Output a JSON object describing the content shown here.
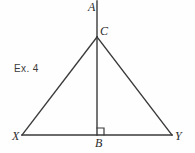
{
  "figure": {
    "caption": "Ex. 4",
    "background_color": "#fefefe",
    "stroke_color": "#3a3a3a",
    "text_color": "#2b2b2b",
    "labels": {
      "apex_ray_top": "A",
      "apex": "C",
      "foot": "B",
      "left_base": "X",
      "right_base": "Y"
    },
    "right_angle_mark": {
      "at": "B",
      "size_px": 7
    },
    "geometry": {
      "points": {
        "A": {
          "x": 97,
          "y": 1
        },
        "C": {
          "x": 97,
          "y": 37
        },
        "B": {
          "x": 97,
          "y": 135
        },
        "X": {
          "x": 22,
          "y": 135
        },
        "Y": {
          "x": 172,
          "y": 135
        }
      },
      "segments": [
        {
          "name": "ray-AC",
          "from": "A",
          "to": "C"
        },
        {
          "name": "altitude-CB",
          "from": "C",
          "to": "B"
        },
        {
          "name": "side-CX",
          "from": "C",
          "to": "X"
        },
        {
          "name": "side-CY",
          "from": "C",
          "to": "Y"
        },
        {
          "name": "base-XY",
          "from": "X",
          "to": "Y"
        }
      ]
    }
  }
}
